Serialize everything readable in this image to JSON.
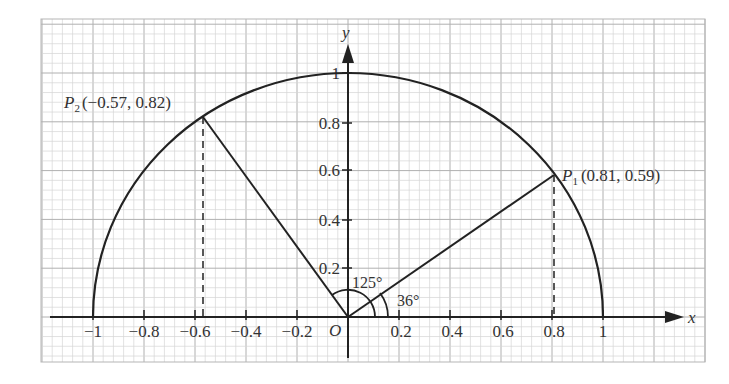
{
  "chart_data": {
    "type": "scatter",
    "title": "",
    "xlabel": "x",
    "ylabel": "y",
    "origin_label": "O",
    "xlim": [
      -1.0,
      1.0
    ],
    "ylim": [
      0,
      1.0
    ],
    "grid": true,
    "x_ticks": [
      "−1",
      "−0.8",
      "−0.6",
      "−0.4",
      "−0.2",
      "0.2",
      "0.4",
      "0.6",
      "0.8",
      "1"
    ],
    "x_tick_values": [
      -1,
      -0.8,
      -0.6,
      -0.4,
      -0.2,
      0.2,
      0.4,
      0.6,
      0.8,
      1
    ],
    "y_ticks": [
      "0.2",
      "0.4",
      "0.6",
      "0.8",
      "1"
    ],
    "y_tick_values": [
      0.2,
      0.4,
      0.6,
      0.8,
      1
    ],
    "curves": [
      {
        "name": "unit semicircle",
        "equation": "x^2 + y^2 = 1",
        "range": "y >= 0"
      }
    ],
    "points": [
      {
        "name": "P1",
        "label_main": "P",
        "label_sub": "1",
        "coords_text": "(0.81, 0.59)",
        "x": 0.81,
        "y": 0.59,
        "angle_deg": 36
      },
      {
        "name": "P2",
        "label_main": "P",
        "label_sub": "2",
        "coords_text": "(−0.57, 0.82)",
        "x": -0.57,
        "y": 0.82,
        "angle_deg": 125
      }
    ],
    "segments": [
      {
        "from": "O",
        "to": "P1",
        "style": "solid"
      },
      {
        "from": "O",
        "to": "P2",
        "style": "solid"
      },
      {
        "from": "P1",
        "to": "(0.81, 0)",
        "style": "dashed"
      },
      {
        "from": "P2",
        "to": "(−0.57, 0)",
        "style": "dashed"
      }
    ],
    "annotations": [
      {
        "text": "125°",
        "meaning": "angle from positive x-axis to OP2"
      },
      {
        "text": "36°",
        "meaning": "angle from positive x-axis to OP1"
      }
    ]
  },
  "labels": {
    "x_axis": "x",
    "y_axis": "y",
    "origin": "O",
    "p1_main": "P",
    "p1_sub": "1",
    "p1_coords": "(0.81, 0.59)",
    "p2_main": "P",
    "p2_sub": "2",
    "p2_coords": "(−0.57, 0.82)",
    "angle_125": "125°",
    "angle_36": "36°",
    "xt_m1": "−1",
    "xt_m08": "−0.8",
    "xt_m06": "−0.6",
    "xt_m04": "−0.4",
    "xt_m02": "−0.2",
    "xt_02": "0.2",
    "xt_04": "0.4",
    "xt_06": "0.6",
    "xt_08": "0.8",
    "xt_1": "1",
    "yt_02": "0.2",
    "yt_04": "0.4",
    "yt_06": "0.6",
    "yt_08": "0.8",
    "yt_1": "1"
  },
  "colors": {
    "ink": "#222222",
    "grid_minor": "#d6d6d6",
    "grid_major": "#b0b0b0",
    "background": "#ffffff"
  }
}
